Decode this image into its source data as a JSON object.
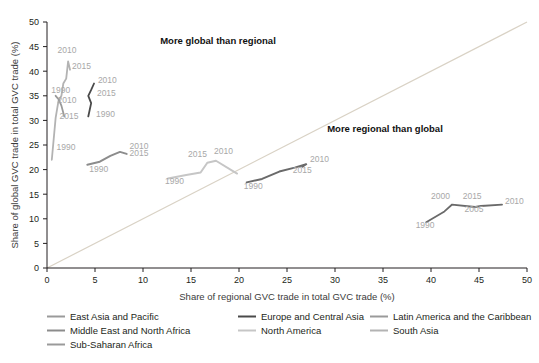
{
  "figure": {
    "quadrant_labels": [
      {
        "text": "More global than regional",
        "x": 218,
        "y": 44
      },
      {
        "text": "More regional than global",
        "x": 385,
        "y": 132
      }
    ]
  },
  "chart_data": {
    "type": "line",
    "title": "",
    "xlabel": "Share of regional GVC trade in total GVC trade (%)",
    "ylabel": "Share of global GVC trade in total GVC trade (%)",
    "xlim": [
      0,
      50
    ],
    "ylim": [
      0,
      50
    ],
    "xticks": [
      0,
      5,
      10,
      15,
      20,
      25,
      30,
      35,
      40,
      45,
      50
    ],
    "yticks": [
      0,
      5,
      10,
      15,
      20,
      25,
      30,
      35,
      40,
      45,
      50
    ],
    "grid": false,
    "legend_position": "bottom-left",
    "diagonal_reference_line": true,
    "series": [
      {
        "name": "East Asia and Pacific",
        "color": "#b3b3b3",
        "width": 1.8,
        "points": [
          {
            "x": 0.5,
            "y": 22.0
          },
          {
            "x": 0.9,
            "y": 30.5
          },
          {
            "x": 1.2,
            "y": 34.0,
            "label": "1990"
          },
          {
            "x": 1.5,
            "y": 35.0
          },
          {
            "x": 1.7,
            "y": 37.5
          },
          {
            "x": 2.0,
            "y": 38.5
          },
          {
            "x": 2.2,
            "y": 42.0,
            "label": "2010"
          },
          {
            "x": 2.4,
            "y": 40.3,
            "label": "2015"
          }
        ],
        "labels": [
          {
            "text": "1990",
            "x": 1.0,
            "y": 24.0,
            "anchor": "start"
          },
          {
            "text": "2010",
            "x": 1.1,
            "y": 43.6,
            "anchor": "start"
          },
          {
            "text": "2015",
            "x": 2.6,
            "y": 40.5,
            "anchor": "start"
          }
        ]
      },
      {
        "name": "Latin America and the Caribbean",
        "color": "#9a9a9a",
        "width": 1.8,
        "points": [
          {
            "x": 0.9,
            "y": 35.0,
            "label": "1990"
          },
          {
            "x": 1.2,
            "y": 34.3
          },
          {
            "x": 1.5,
            "y": 33.0,
            "label": "2010"
          },
          {
            "x": 1.8,
            "y": 30.8,
            "label": "2015"
          }
        ],
        "labels": [
          {
            "text": "1990",
            "x": 0.45,
            "y": 35.6,
            "anchor": "start"
          },
          {
            "text": "2010",
            "x": 1.1,
            "y": 33.5,
            "anchor": "start"
          },
          {
            "text": "2015",
            "x": 1.3,
            "y": 30.3,
            "anchor": "start"
          }
        ]
      },
      {
        "name": "Europe and Central Asia",
        "color": "#4a4a4a",
        "width": 1.8,
        "points": [
          {
            "x": 4.3,
            "y": 30.8,
            "label": "1990"
          },
          {
            "x": 4.6,
            "y": 33.5
          },
          {
            "x": 4.3,
            "y": 35.0,
            "label": "2015"
          },
          {
            "x": 4.6,
            "y": 36.2
          },
          {
            "x": 4.9,
            "y": 37.5,
            "label": "2010"
          }
        ],
        "labels": [
          {
            "text": "1990",
            "x": 5.1,
            "y": 30.6,
            "anchor": "start"
          },
          {
            "text": "2015",
            "x": 5.2,
            "y": 35.0,
            "anchor": "start"
          },
          {
            "text": "2010",
            "x": 5.3,
            "y": 37.6,
            "anchor": "start"
          }
        ]
      },
      {
        "name": "Sub-Saharan Africa",
        "color": "#8c8c8c",
        "width": 2.0,
        "points": [
          {
            "x": 4.2,
            "y": 21.0,
            "label": "1990"
          },
          {
            "x": 5.5,
            "y": 21.6
          },
          {
            "x": 6.6,
            "y": 22.8
          },
          {
            "x": 7.6,
            "y": 23.6,
            "label": "2010"
          },
          {
            "x": 8.3,
            "y": 23.2,
            "label": "2015"
          }
        ],
        "labels": [
          {
            "text": "1990",
            "x": 4.4,
            "y": 19.6,
            "anchor": "start"
          },
          {
            "text": "2010",
            "x": 8.6,
            "y": 24.2,
            "anchor": "start"
          },
          {
            "text": "2015",
            "x": 8.6,
            "y": 22.7,
            "anchor": "start"
          }
        ]
      },
      {
        "name": "North America",
        "color": "#c6c6c6",
        "width": 2.0,
        "points": [
          {
            "x": 12.6,
            "y": 18.2,
            "label": "1990"
          },
          {
            "x": 14.5,
            "y": 18.9
          },
          {
            "x": 16.0,
            "y": 19.4
          },
          {
            "x": 16.7,
            "y": 21.4,
            "label": "2015"
          },
          {
            "x": 17.6,
            "y": 21.8,
            "label": "2010"
          },
          {
            "x": 19.8,
            "y": 19.2
          }
        ],
        "labels": [
          {
            "text": "1990",
            "x": 12.3,
            "y": 17.0,
            "anchor": "start"
          },
          {
            "text": "2015",
            "x": 14.7,
            "y": 22.6,
            "anchor": "start"
          },
          {
            "text": "2010",
            "x": 17.4,
            "y": 23.2,
            "anchor": "start"
          }
        ]
      },
      {
        "name": "South Asia",
        "color": "#6a6a6a",
        "width": 2.0,
        "points": [
          {
            "x": 20.8,
            "y": 17.4,
            "label": "1990"
          },
          {
            "x": 22.4,
            "y": 18.1
          },
          {
            "x": 24.2,
            "y": 19.6
          },
          {
            "x": 25.8,
            "y": 20.4
          },
          {
            "x": 27.0,
            "y": 21.1,
            "label": "2010"
          },
          {
            "x": 26.6,
            "y": 20.6,
            "label": "2015"
          }
        ],
        "labels": [
          {
            "text": "1990",
            "x": 20.5,
            "y": 16.1,
            "anchor": "start"
          },
          {
            "text": "2010",
            "x": 27.4,
            "y": 21.6,
            "anchor": "start"
          },
          {
            "text": "2015",
            "x": 25.6,
            "y": 19.3,
            "anchor": "start"
          }
        ]
      },
      {
        "name": "Middle East and North Africa",
        "color": "#6a6a6a",
        "width": 1.8,
        "points": [
          {
            "x": 39.5,
            "y": 9.3,
            "label": "1990"
          },
          {
            "x": 41.4,
            "y": 11.5
          },
          {
            "x": 42.2,
            "y": 12.9,
            "label": "2000"
          },
          {
            "x": 44.6,
            "y": 12.4,
            "label": "2005"
          },
          {
            "x": 45.2,
            "y": 12.6,
            "label": "2015"
          },
          {
            "x": 47.4,
            "y": 12.9,
            "label": "2010"
          }
        ],
        "labels": [
          {
            "text": "1990",
            "x": 38.4,
            "y": 8.2,
            "anchor": "start"
          },
          {
            "text": "2000",
            "x": 40.0,
            "y": 14.0,
            "anchor": "start"
          },
          {
            "text": "2015",
            "x": 43.3,
            "y": 14.1,
            "anchor": "start"
          },
          {
            "text": "2005",
            "x": 43.5,
            "y": 11.3,
            "anchor": "start"
          },
          {
            "text": "2010",
            "x": 47.7,
            "y": 13.0,
            "anchor": "start"
          }
        ]
      }
    ]
  },
  "legend": {
    "items": [
      {
        "label": "East Asia and Pacific",
        "color": "#9a9a9a",
        "col": 0,
        "row": 0
      },
      {
        "label": "Europe and Central Asia",
        "color": "#4a4a4a",
        "col": 1,
        "row": 0
      },
      {
        "label": "Latin America and the Caribbean",
        "color": "#9a9a9a",
        "col": 2,
        "row": 0
      },
      {
        "label": "Middle East and North Africa",
        "color": "#8c8c8c",
        "col": 0,
        "row": 1
      },
      {
        "label": "North America",
        "color": "#c6c6c6",
        "col": 1,
        "row": 1
      },
      {
        "label": "South Asia",
        "color": "#b3b3b3",
        "col": 2,
        "row": 1
      },
      {
        "label": "Sub-Saharan Africa",
        "color": "#9a9a9a",
        "col": 0,
        "row": 2
      }
    ]
  },
  "colors": {
    "axis": "#231f20",
    "diagonal": "#d9d2c5",
    "text": "#231f20",
    "label_gray": "#a8a8a8"
  }
}
